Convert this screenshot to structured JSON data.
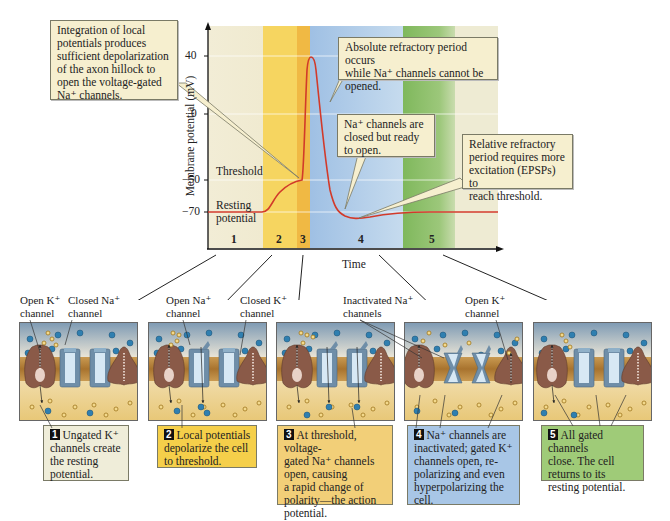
{
  "graph": {
    "y_axis_label": "Membrane potential (mV)",
    "x_axis_label": "Time",
    "y_ticks": [
      "40",
      "0",
      "−50",
      "−70"
    ],
    "threshold_label": "Threshold",
    "resting_label_line1": "Resting",
    "resting_label_line2": "potential",
    "phase_numbers": [
      "1",
      "2",
      "3",
      "4",
      "5"
    ],
    "phase_colors": [
      "#f1ecd2",
      "#f6d35a",
      "#f0b840",
      "#a9c7e6",
      "#8dc06a",
      "#eeebd2"
    ],
    "trace_color": "#d23a2a"
  },
  "callouts": {
    "integration": [
      "Integration of local",
      "potentials produces",
      "sufficient depolarization",
      "of the axon hillock to",
      "open the voltage-gated",
      "Na⁺ channels."
    ],
    "absolute": [
      "Absolute refractory period occurs",
      "while Na⁺ channels cannot be",
      "opened."
    ],
    "closed_ready": [
      "Na⁺ channels are",
      "closed but ready",
      "to open."
    ],
    "relative": [
      "Relative refractory",
      "period requires more",
      "excitation (EPSPs) to",
      "reach threshold."
    ]
  },
  "channel_labels": {
    "open_k_1": [
      "Open K⁺",
      "channel"
    ],
    "closed_na": [
      "Closed Na⁺",
      "channel"
    ],
    "open_na": [
      "Open Na⁺",
      "channel"
    ],
    "closed_k": [
      "Closed K⁺",
      "channel"
    ],
    "inactivated_na": [
      "Inactivated Na⁺",
      "channels"
    ],
    "open_k_4": [
      "Open K⁺",
      "channel"
    ]
  },
  "steps": [
    {
      "num": "1",
      "lines": [
        "Ungated K⁺",
        "channels create",
        "the resting",
        "potential."
      ],
      "color": "#efedd9"
    },
    {
      "num": "2",
      "lines": [
        "Local potentials",
        "depolarize the cell",
        "to threshold."
      ],
      "color": "#f5cf4a"
    },
    {
      "num": "3",
      "lines": [
        "At threshold, voltage-",
        "gated Na⁺ channels",
        "open, causing",
        "a rapid change of",
        "polarity—the action",
        "potential."
      ],
      "color": "#f2cf78"
    },
    {
      "num": "4",
      "lines": [
        "Na⁺ channels are",
        "inactivated; gated K⁺",
        "channels open, re-",
        "polarizing and even",
        "hyperpolarizing the",
        "cell."
      ],
      "color": "#a8c6e6"
    },
    {
      "num": "5",
      "lines": [
        "All gated channels",
        "close. The cell",
        "returns to its",
        "resting potential."
      ],
      "color": "#9fcb78"
    }
  ],
  "icons": {
    "k_ion": "orange-ring-dot",
    "na_ion": "blue-dot",
    "k_leak_channel": "brown-ungated-k-channel",
    "na_channel": "blue-voltage-gated-na-channel",
    "k_gated_channel": "brown-gated-k-channel"
  }
}
